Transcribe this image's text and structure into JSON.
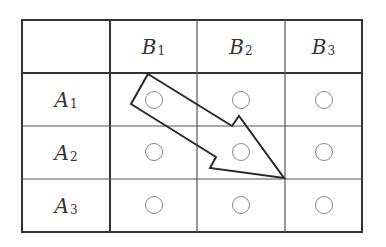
{
  "table": {
    "columns": [
      {
        "letter": "B",
        "index": "1"
      },
      {
        "letter": "B",
        "index": "2"
      },
      {
        "letter": "B",
        "index": "3"
      }
    ],
    "rows": [
      {
        "letter": "A",
        "index": "1",
        "cells": [
          "○",
          "○",
          "○"
        ]
      },
      {
        "letter": "A",
        "index": "2",
        "cells": [
          "○",
          "○",
          "○"
        ]
      },
      {
        "letter": "A",
        "index": "3",
        "cells": [
          "○",
          "○",
          "○"
        ]
      }
    ],
    "corner_cell": ""
  },
  "arrow": {
    "description": "Outlined arrow from cell (A1,B1) pointing diagonally to the corner between (A2,B2) and (A3,B3)",
    "from_cell": "A1-B1",
    "to_point": "corner A2/B2 bottom-right"
  },
  "colors": {
    "grid_line": "#333333",
    "inner_line": "#555555",
    "circle": "#8a8a8a",
    "text": "#333333",
    "arrow": "#2a2a2a"
  }
}
